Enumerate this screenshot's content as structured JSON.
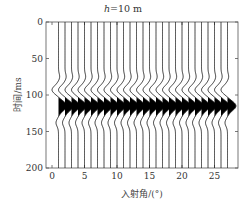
{
  "chart_data": {
    "type": "wiggle",
    "title_prefix": "h",
    "title_suffix": "=10 m",
    "title": "h=10 m",
    "xlabel": "入射角/(°)",
    "ylabel": "时间/ms",
    "xlim": [
      -1,
      28
    ],
    "ylim": [
      200,
      0
    ],
    "xticks": [
      0,
      5,
      10,
      15,
      20,
      25
    ],
    "yticks": [
      0,
      50,
      100,
      150,
      200
    ],
    "traces_x": [
      1,
      2,
      3,
      4,
      5,
      6,
      7,
      8,
      9,
      10,
      11,
      12,
      13,
      14,
      15,
      16,
      17,
      18,
      19,
      20,
      21,
      22,
      23,
      24,
      25,
      26,
      27
    ],
    "wavelet": {
      "negative_lobe_center_ms": 93,
      "positive_lobe_center_ms": 115,
      "positive_fill": "#000000",
      "trace_color": "#222222"
    }
  },
  "colors": {
    "axis": "#555555",
    "text": "#333333"
  }
}
